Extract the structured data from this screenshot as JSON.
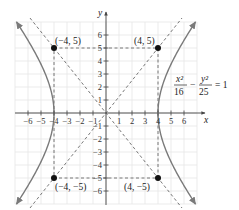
{
  "figure": {
    "type": "hyperbola-graph",
    "equation": {
      "num1": "x²",
      "den1": "16",
      "minus": "−",
      "num2": "y²",
      "den2": "25",
      "rhs": "= 1"
    },
    "axes": {
      "x_label": "x",
      "y_label": "y",
      "x_ticks": [
        "−6",
        "−5",
        "−4",
        "−3",
        "−2",
        "−1",
        "1",
        "2",
        "3",
        "4",
        "5",
        "6"
      ],
      "y_ticks": [
        "6",
        "5",
        "4",
        "3",
        "2",
        "1",
        "−1",
        "−2",
        "−3",
        "−4",
        "−5",
        "−6"
      ]
    },
    "points": [
      {
        "label": "(−4, 5)",
        "x": -4,
        "y": 5
      },
      {
        "label": "(4, 5)",
        "x": 4,
        "y": 5
      },
      {
        "label": "(−4, −5)",
        "x": -4,
        "y": -5
      },
      {
        "label": "(4, −5)",
        "x": 4,
        "y": -5
      }
    ],
    "asymptotes": [
      "y = 5x/4",
      "y = −5x/4"
    ],
    "colors": {
      "curve": "#7a7a7a",
      "grid": "#e4e4e4",
      "axis": "#444444",
      "dashed": "#555555",
      "point": "#111111"
    }
  },
  "chart_data": {
    "type": "line",
    "xlabel": "x",
    "ylabel": "y",
    "xlim": [
      -7,
      7
    ],
    "ylim": [
      -7,
      7
    ],
    "grid": true,
    "series": [
      {
        "name": "hyperbola right branch",
        "vertex": [
          4,
          0
        ]
      },
      {
        "name": "hyperbola left branch",
        "vertex": [
          -4,
          0
        ]
      },
      {
        "name": "asymptote y=1.25x",
        "style": "dashed"
      },
      {
        "name": "asymptote y=-1.25x",
        "style": "dashed"
      }
    ],
    "annotations": [
      "(−4, 5)",
      "(4, 5)",
      "(−4, −5)",
      "(4, −5)"
    ]
  }
}
